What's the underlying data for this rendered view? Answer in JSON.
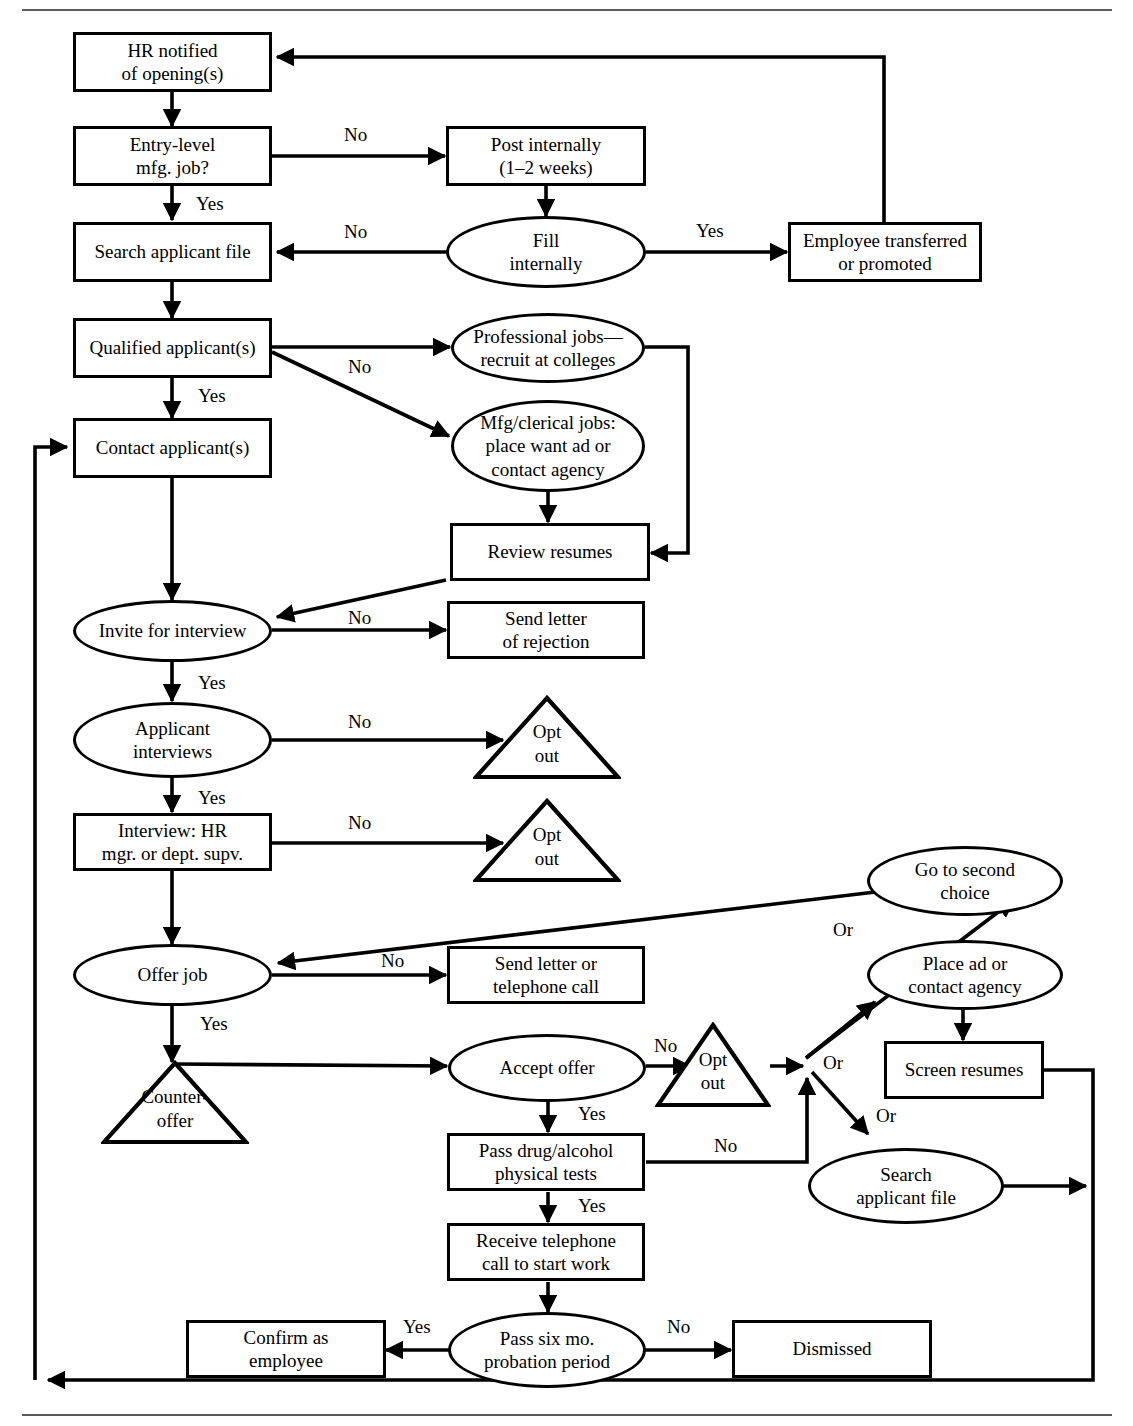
{
  "diagram": {
    "type": "flowchart",
    "colors": {
      "stroke": "#000000",
      "fill": "#ffffff",
      "rule": "#5a5a5a"
    },
    "nodes": [
      {
        "id": "hr_notified",
        "shape": "box",
        "text": "HR notified\nof opening(s)"
      },
      {
        "id": "entry_level",
        "shape": "box",
        "text": "Entry-level\nmfg. job?"
      },
      {
        "id": "search_file",
        "shape": "box",
        "text": "Search applicant file"
      },
      {
        "id": "qualified",
        "shape": "box",
        "text": "Qualified applicant(s)"
      },
      {
        "id": "contact",
        "shape": "box",
        "text": "Contact applicant(s)"
      },
      {
        "id": "post_internally",
        "shape": "box",
        "text": "Post internally\n(1–2 weeks)"
      },
      {
        "id": "fill_internally",
        "shape": "ellipse",
        "text": "Fill\ninternally"
      },
      {
        "id": "employee_transfer",
        "shape": "box",
        "text": "Employee transferred\nor promoted"
      },
      {
        "id": "professional_jobs",
        "shape": "ellipse",
        "text": "Professional jobs—\nrecruit at colleges"
      },
      {
        "id": "mfg_clerical",
        "shape": "ellipse",
        "text": "Mfg/clerical jobs:\nplace want ad or\ncontact agency"
      },
      {
        "id": "review_resumes",
        "shape": "box",
        "text": "Review resumes"
      },
      {
        "id": "invite_interview",
        "shape": "ellipse",
        "text": "Invite for interview"
      },
      {
        "id": "send_rejection",
        "shape": "box",
        "text": "Send letter\nof rejection"
      },
      {
        "id": "applicant_interviews",
        "shape": "ellipse",
        "text": "Applicant\ninterviews"
      },
      {
        "id": "opt_out_1",
        "shape": "triangle",
        "text": "Opt\nout"
      },
      {
        "id": "interview_hr",
        "shape": "box",
        "text": "Interview: HR\nmgr. or dept. supv."
      },
      {
        "id": "opt_out_2",
        "shape": "triangle",
        "text": "Opt\nout"
      },
      {
        "id": "offer_job",
        "shape": "ellipse",
        "text": "Offer job"
      },
      {
        "id": "send_letter_call",
        "shape": "box",
        "text": "Send letter or\ntelephone call"
      },
      {
        "id": "counter_offer",
        "shape": "triangle",
        "text": "Counter-\noffer"
      },
      {
        "id": "accept_offer",
        "shape": "ellipse",
        "text": "Accept offer"
      },
      {
        "id": "opt_out_3",
        "shape": "triangle",
        "text": "Opt\nout"
      },
      {
        "id": "pass_drug",
        "shape": "box",
        "text": "Pass drug/alcohol\nphysical tests"
      },
      {
        "id": "receive_call",
        "shape": "box",
        "text": "Receive telephone\ncall to start work"
      },
      {
        "id": "probation",
        "shape": "ellipse",
        "text": "Pass six mo.\nprobation period"
      },
      {
        "id": "confirm_employee",
        "shape": "box",
        "text": "Confirm as\nemployee"
      },
      {
        "id": "dismissed",
        "shape": "box",
        "text": "Dismissed"
      },
      {
        "id": "second_choice",
        "shape": "ellipse",
        "text": "Go to second\nchoice"
      },
      {
        "id": "place_ad",
        "shape": "ellipse",
        "text": "Place ad or\ncontact agency"
      },
      {
        "id": "screen_resumes",
        "shape": "box",
        "text": "Screen resumes"
      },
      {
        "id": "search_file_2",
        "shape": "ellipse",
        "text": "Search\napplicant file"
      }
    ],
    "edge_labels": [
      {
        "id": "lbl_no_entry",
        "text": "No"
      },
      {
        "id": "lbl_yes_entry",
        "text": "Yes"
      },
      {
        "id": "lbl_no_fill",
        "text": "No"
      },
      {
        "id": "lbl_yes_fill",
        "text": "Yes"
      },
      {
        "id": "lbl_no_qualified",
        "text": "No"
      },
      {
        "id": "lbl_yes_qualified",
        "text": "Yes"
      },
      {
        "id": "lbl_no_invite",
        "text": "No"
      },
      {
        "id": "lbl_yes_invite",
        "text": "Yes"
      },
      {
        "id": "lbl_no_appint",
        "text": "No"
      },
      {
        "id": "lbl_yes_appint",
        "text": "Yes"
      },
      {
        "id": "lbl_no_inthr",
        "text": "No"
      },
      {
        "id": "lbl_no_offer",
        "text": "No"
      },
      {
        "id": "lbl_yes_offer",
        "text": "Yes"
      },
      {
        "id": "lbl_no_accept",
        "text": "No"
      },
      {
        "id": "lbl_yes_accept",
        "text": "Yes"
      },
      {
        "id": "lbl_no_drug",
        "text": "No"
      },
      {
        "id": "lbl_yes_drug",
        "text": "Yes"
      },
      {
        "id": "lbl_yes_prob",
        "text": "Yes"
      },
      {
        "id": "lbl_no_prob",
        "text": "No"
      },
      {
        "id": "lbl_or_1",
        "text": "Or"
      },
      {
        "id": "lbl_or_2",
        "text": "Or"
      },
      {
        "id": "lbl_or_3",
        "text": "Or"
      }
    ]
  }
}
